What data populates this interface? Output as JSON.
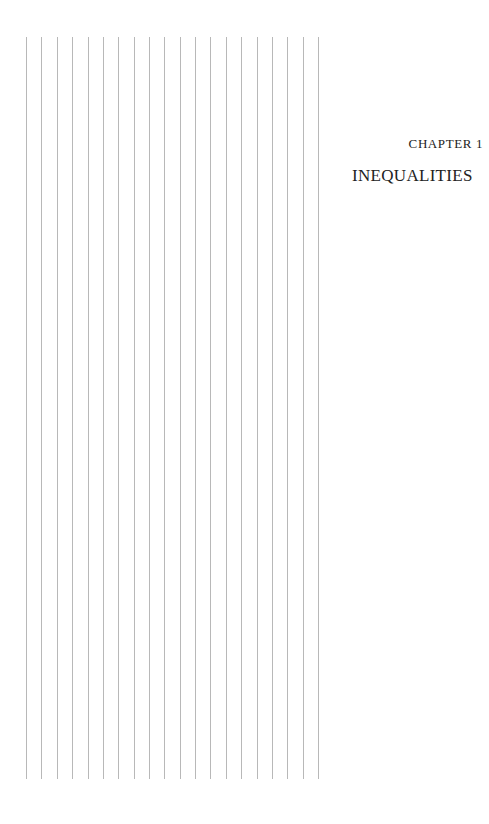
{
  "chapter": {
    "label": "CHAPTER 1",
    "title": "INEQUALITIES"
  },
  "ruled_margin": {
    "line_count": 20,
    "line_x_positions": [
      26,
      41,
      57,
      72,
      88,
      103,
      118,
      134,
      149,
      164,
      180,
      195,
      210,
      226,
      241,
      257,
      272,
      287,
      303,
      318
    ],
    "line_color": "#b8b8b8"
  }
}
